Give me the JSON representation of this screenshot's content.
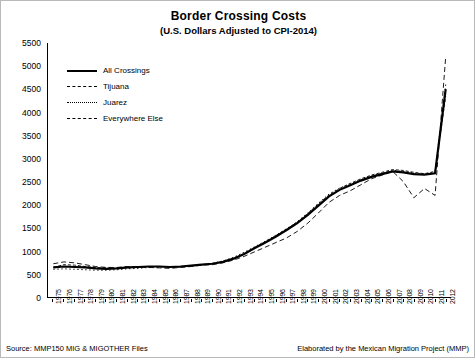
{
  "chart_data": {
    "type": "line",
    "title": "Border Crossing Costs",
    "subtitle": "(U.S. Dollars Adjusted to CPI-2014)",
    "xlabel": "",
    "ylabel": "",
    "ylim": [
      0,
      5500
    ],
    "yticks": [
      0,
      500,
      1000,
      1500,
      2000,
      2500,
      3000,
      3500,
      4000,
      4500,
      5000,
      5500
    ],
    "grid": false,
    "legend_position": "top-left",
    "categories": [
      "1975",
      "1976",
      "1977",
      "1978",
      "1979",
      "1980",
      "1981",
      "1982",
      "1983",
      "1984",
      "1985",
      "1986",
      "1987",
      "1988",
      "1989",
      "1990",
      "1991",
      "1992",
      "1993",
      "1994",
      "1995",
      "1996",
      "1997",
      "1998",
      "1999",
      "2000",
      "2001",
      "2002",
      "2003",
      "2004",
      "2005",
      "2006",
      "2007",
      "2008",
      "2009",
      "2010",
      "2011",
      "2012"
    ],
    "series": [
      {
        "name": "All Crossings",
        "style": "solid-thick",
        "values": [
          640,
          660,
          650,
          640,
          620,
          610,
          620,
          640,
          650,
          660,
          660,
          650,
          660,
          680,
          700,
          720,
          760,
          830,
          930,
          1060,
          1180,
          1310,
          1450,
          1600,
          1780,
          1980,
          2180,
          2320,
          2420,
          2520,
          2600,
          2660,
          2720,
          2700,
          2660,
          2650,
          2680,
          4500
        ]
      },
      {
        "name": "Tijuana",
        "style": "dashed",
        "values": [
          720,
          760,
          740,
          700,
          660,
          640,
          640,
          660,
          650,
          640,
          630,
          620,
          640,
          660,
          690,
          700,
          740,
          800,
          880,
          980,
          1080,
          1180,
          1280,
          1420,
          1600,
          1820,
          2050,
          2200,
          2300,
          2430,
          2560,
          2640,
          2720,
          2500,
          2150,
          2350,
          2200,
          5200
        ]
      },
      {
        "name": "Juarez",
        "style": "dotted",
        "values": [
          600,
          610,
          600,
          590,
          580,
          580,
          590,
          610,
          620,
          640,
          650,
          650,
          660,
          680,
          700,
          730,
          780,
          860,
          970,
          1090,
          1210,
          1340,
          1480,
          1630,
          1820,
          2030,
          2230,
          2360,
          2450,
          2540,
          2620,
          2680,
          2740,
          2720,
          2680,
          2660,
          2700,
          4600
        ]
      },
      {
        "name": "Everywhere Else",
        "style": "dashed-fine",
        "values": [
          640,
          700,
          690,
          660,
          640,
          630,
          620,
          630,
          640,
          660,
          660,
          640,
          650,
          670,
          700,
          720,
          770,
          840,
          940,
          1070,
          1200,
          1330,
          1470,
          1620,
          1810,
          2020,
          2210,
          2350,
          2460,
          2560,
          2640,
          2700,
          2760,
          2740,
          2700,
          2670,
          2720,
          4350
        ]
      }
    ],
    "legend": [
      {
        "label": "All Crossings",
        "style": "solid-thick"
      },
      {
        "label": "Tijuana",
        "style": "dashed"
      },
      {
        "label": "Juarez",
        "style": "dotted"
      },
      {
        "label": "Everywhere Else",
        "style": "dashed-fine"
      }
    ],
    "footer_left": "Source: MMP150  MIG & MIGOTHER Files",
    "footer_right": "Elaborated by the Mexican Migration Project (MMP)"
  }
}
